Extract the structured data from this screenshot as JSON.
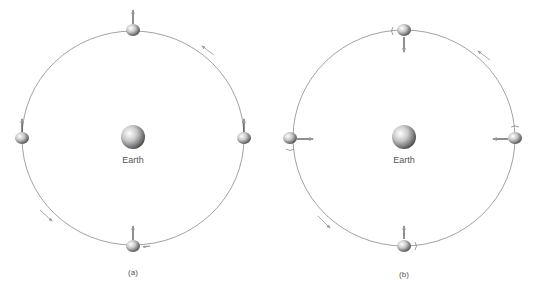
{
  "panels": [
    {
      "id": "a",
      "caption": "(a)",
      "center_label": "Earth",
      "description": "Moon orbiting Earth with a fixed orientation (no rotation): arrow always points up"
    },
    {
      "id": "b",
      "caption": "(b)",
      "center_label": "Earth",
      "description": "Moon orbiting Earth with synchronous rotation: arrow always points toward Earth"
    }
  ],
  "colors": {
    "orbit": "#8a8a8a",
    "arrow": "#444444",
    "motion_arrow": "#9a9a9a",
    "text": "#555555"
  }
}
